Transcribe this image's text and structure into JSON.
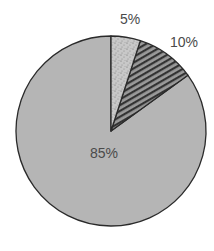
{
  "chart_data": {
    "type": "pie",
    "title": "",
    "start_angle_deg": 0,
    "direction": "clockwise",
    "categories": [
      "Slice A",
      "Slice B",
      "Slice C"
    ],
    "values": [
      5,
      10,
      85
    ],
    "labels": [
      "5%",
      "10%",
      "85%"
    ],
    "slices": [
      {
        "value": 5,
        "label": "5%",
        "fill": "#c8c8c8",
        "pattern": "speckle"
      },
      {
        "value": 10,
        "label": "10%",
        "fill": "#9a9a9a",
        "pattern": "diagonal-stripes"
      },
      {
        "value": 85,
        "label": "85%",
        "fill": "#b5b5b5",
        "pattern": "solid"
      }
    ],
    "legend": null,
    "label_positions": [
      {
        "x": 130,
        "y": 24
      },
      {
        "x": 184,
        "y": 47
      },
      {
        "x": 104,
        "y": 158
      }
    ],
    "center": {
      "x": 111,
      "y": 131
    },
    "radius": 95
  },
  "colors": {
    "outline": "#2a2a2a",
    "stripe": "#333333",
    "speckle": "#6a6a6a",
    "label_text": "#4a4a4a"
  }
}
